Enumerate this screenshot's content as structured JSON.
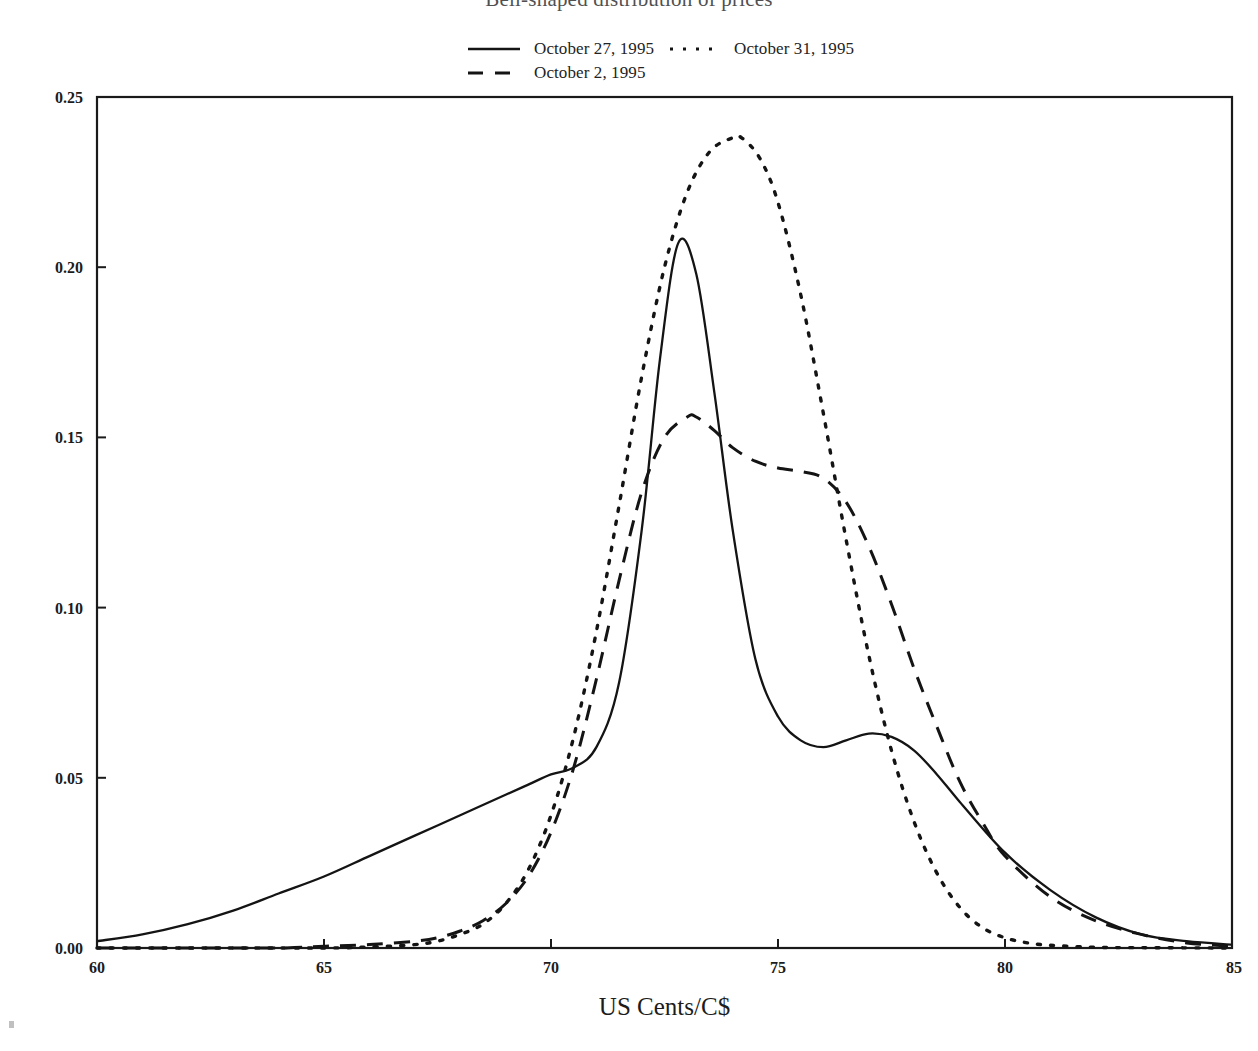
{
  "chart_data": {
    "type": "line",
    "title": "Bell-shaped distribution of prices",
    "xlabel": "US Cents/C$",
    "ylabel": "",
    "xlim": [
      60,
      85
    ],
    "ylim": [
      0.0,
      0.25
    ],
    "xticks": [
      60,
      65,
      70,
      75,
      80,
      85
    ],
    "xtick_labels": [
      "60",
      "65",
      "70",
      "75",
      "80",
      "85"
    ],
    "yticks": [
      0.0,
      0.05,
      0.1,
      0.15,
      0.2,
      0.25
    ],
    "ytick_labels": [
      "0.00",
      "0.05",
      "0.10",
      "0.15",
      "0.20",
      "0.25"
    ],
    "grid": false,
    "legend_position": "above-plot",
    "series": [
      {
        "name": "October 27, 1995",
        "style": "solid",
        "color": "#141414",
        "x": [
          60,
          61,
          62,
          63,
          64,
          65,
          66,
          67,
          68,
          69,
          69.5,
          70,
          70.5,
          71,
          71.5,
          72,
          72.4,
          72.8,
          73.2,
          73.6,
          74,
          74.5,
          75,
          75.5,
          76,
          76.5,
          77,
          77.5,
          78,
          78.5,
          79,
          80,
          81,
          82,
          83,
          84,
          85
        ],
        "y": [
          0.002,
          0.004,
          0.007,
          0.011,
          0.016,
          0.021,
          0.027,
          0.033,
          0.039,
          0.045,
          0.048,
          0.051,
          0.053,
          0.059,
          0.078,
          0.123,
          0.173,
          0.207,
          0.198,
          0.163,
          0.123,
          0.085,
          0.068,
          0.061,
          0.059,
          0.061,
          0.063,
          0.062,
          0.058,
          0.051,
          0.043,
          0.028,
          0.017,
          0.009,
          0.004,
          0.002,
          0.001
        ]
      },
      {
        "name": "October 2, 1995",
        "style": "dashed",
        "color": "#141414",
        "x": [
          60,
          62,
          64,
          65,
          66,
          67,
          67.5,
          68,
          68.5,
          69,
          69.5,
          70,
          70.5,
          71,
          71.5,
          72,
          72.5,
          73,
          73.2,
          73.6,
          74,
          74.5,
          75,
          75.5,
          76,
          76.5,
          77,
          77.5,
          78,
          78.5,
          79,
          79.5,
          80,
          81,
          82,
          83,
          84,
          85
        ],
        "y": [
          0.0,
          0.0,
          0.0,
          0.0005,
          0.001,
          0.002,
          0.003,
          0.005,
          0.008,
          0.013,
          0.021,
          0.034,
          0.053,
          0.079,
          0.108,
          0.134,
          0.15,
          0.156,
          0.156,
          0.152,
          0.147,
          0.143,
          0.141,
          0.14,
          0.138,
          0.131,
          0.118,
          0.101,
          0.082,
          0.065,
          0.049,
          0.037,
          0.027,
          0.015,
          0.008,
          0.004,
          0.0015,
          0.0005
        ]
      },
      {
        "name": "October 31, 1995",
        "style": "dotted",
        "color": "#141414",
        "x": [
          60,
          63,
          65,
          66,
          67,
          67.5,
          68,
          68.5,
          69,
          69.5,
          70,
          70.5,
          71,
          71.5,
          72,
          72.5,
          73,
          73.5,
          74,
          74.2,
          74.6,
          75,
          75.5,
          76,
          76.5,
          77,
          77.5,
          78,
          78.5,
          79,
          79.5,
          80,
          80.5,
          81,
          82,
          83,
          85
        ],
        "y": [
          0.0,
          0.0,
          0.0,
          0.0003,
          0.001,
          0.002,
          0.004,
          0.007,
          0.013,
          0.023,
          0.039,
          0.062,
          0.093,
          0.13,
          0.168,
          0.2,
          0.222,
          0.234,
          0.238,
          0.238,
          0.232,
          0.219,
          0.192,
          0.157,
          0.12,
          0.086,
          0.058,
          0.037,
          0.022,
          0.012,
          0.006,
          0.003,
          0.0015,
          0.0008,
          0.0002,
          0.0001,
          0.0
        ]
      }
    ]
  },
  "legend": {
    "entries": [
      {
        "label": "October 27, 1995",
        "style": "solid"
      },
      {
        "label": "October 2, 1995",
        "style": "dashed"
      },
      {
        "label": "October 31, 1995",
        "style": "dotted"
      }
    ]
  },
  "axis": {
    "x_title": "US Cents/C$"
  }
}
